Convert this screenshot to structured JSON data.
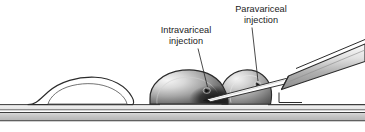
{
  "figure": {
    "kind": "medical-illustration",
    "labels": {
      "intravariceal": {
        "line1": "Intravariceal",
        "line2": "injection"
      },
      "paravariceal": {
        "line1": "Paravariceal",
        "line2": "injection"
      }
    },
    "structures": {
      "left_varix": "unfilled-varix-dome",
      "large_varix": "shaded-varix-dome-intravariceal-target",
      "small_varix": "shaded-varix-dome-paravariceal-target",
      "needle": "injection-needle",
      "endoscope": "endoscope-catheter-shaft",
      "wall_layers": "esophageal-wall-layers"
    },
    "colors": {
      "outline": "#2b2b2b",
      "text": "#1a1a1a",
      "varix_light": "#f2f2f2",
      "varix_mid": "#9a9a9a",
      "varix_dark": "#2e2e2e",
      "wall_band": "#c9c9c9",
      "wall_line": "#4a4a4a",
      "scope_light": "#f0f0f0",
      "scope_mid": "#b5b5b5",
      "background": "#ffffff"
    }
  }
}
